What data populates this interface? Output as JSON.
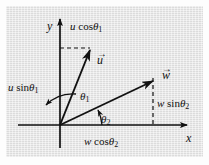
{
  "figure": {
    "type": "vector-decomposition-diagram",
    "background_color": "#e2e2e2",
    "ink_color": "#111111",
    "axes": {
      "x_label": "x",
      "y_label": "y",
      "origin_px": [
        60,
        125
      ]
    },
    "vectors": [
      {
        "name": "u",
        "label": "u",
        "arrow_accent": "→",
        "tip_px": [
          90,
          48
        ],
        "angle_label": "θ",
        "angle_sub": "1",
        "x_component_label_prefix": "u",
        "x_component_label_fn": "sin",
        "y_component_label_prefix": "u",
        "y_component_label_fn": "cos"
      },
      {
        "name": "w",
        "label": "w",
        "arrow_accent": "→",
        "tip_px": [
          152,
          80
        ],
        "angle_label": "θ",
        "angle_sub": "2",
        "x_component_label_prefix": "w",
        "x_component_label_fn": "cos",
        "y_component_label_prefix": "w",
        "y_component_label_fn": "sin"
      }
    ],
    "labels": {
      "u_cos_theta1": {
        "text_parts": [
          "u",
          " cos",
          "θ",
          "1"
        ],
        "pos_px": [
          70,
          23
        ]
      },
      "u_sin_theta1": {
        "text_parts": [
          "u",
          " sin",
          "θ",
          "1"
        ],
        "pos_px": [
          8,
          83
        ]
      },
      "w_sin_theta2": {
        "text_parts": [
          "w",
          " sin",
          "θ",
          "2"
        ],
        "pos_px": [
          157,
          99
        ]
      },
      "w_cos_theta2": {
        "text_parts": [
          "w",
          " cos",
          "θ",
          "2"
        ],
        "pos_px": [
          84,
          137
        ]
      },
      "theta1": {
        "text_parts": [
          "θ",
          "1"
        ],
        "pos_px": [
          80,
          92
        ]
      },
      "theta2": {
        "text_parts": [
          "θ",
          "2"
        ],
        "pos_px": [
          101,
          115
        ]
      },
      "vec_u": {
        "letter": "u",
        "pos_px": [
          97,
          55
        ]
      },
      "vec_w": {
        "letter": "w",
        "pos_px": [
          163,
          70
        ]
      },
      "axis_x": {
        "letter": "x",
        "pos_px": [
          186,
          133
        ]
      },
      "axis_y": {
        "letter": "y",
        "pos_px": [
          47,
          21
        ]
      }
    }
  }
}
